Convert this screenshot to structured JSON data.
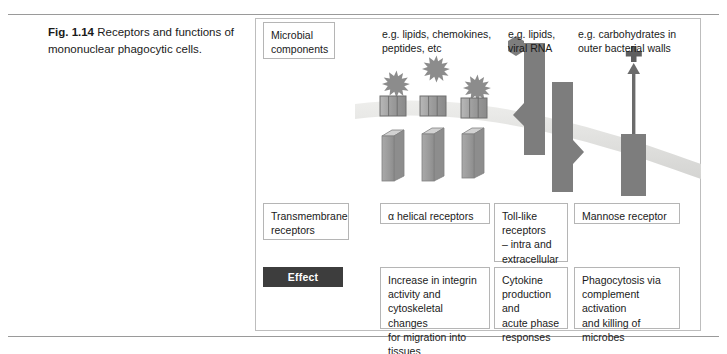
{
  "figure": {
    "number": "Fig. 1.14",
    "caption": "Receptors and functions of mononuclear phagocytic cells."
  },
  "row_labels": {
    "microbial_components": "Microbial\ncomponents",
    "transmembrane_receptors": "Transmembrane\nreceptors",
    "effect": "Effect"
  },
  "ligands": [
    {
      "name": "alpha-helical-ligands",
      "text": "e.g. lipids, chemokines,\npeptides, etc"
    },
    {
      "name": "toll-like-ligands",
      "text": "e.g. lipids,\nviral RNA"
    },
    {
      "name": "mannose-ligands",
      "text": "e.g. carbohydrates in\nouter bacterial walls"
    }
  ],
  "receptors": [
    {
      "name": "alpha-helical-receptor",
      "text": "α helical receptors"
    },
    {
      "name": "toll-like-receptor",
      "text": "Toll-like\nreceptors\n– intra and\nextracellular"
    },
    {
      "name": "mannose-receptor",
      "text": "Mannose receptor"
    }
  ],
  "effects": [
    {
      "name": "integrin-effect",
      "text": "Increase in integrin\nactivity and\ncytoskeletal changes\nfor migration into\ntissues"
    },
    {
      "name": "cytokine-effect",
      "text": "Cytokine\nproduction and\nacute phase\nresponses"
    },
    {
      "name": "phagocytosis-effect",
      "text": "Phagocytosis via\ncomplement activation\nand killing of\nmicrobes"
    }
  ],
  "colors": {
    "membrane": "#e2e2e0",
    "receptor_dark": "#7d7d7d",
    "receptor_mid": "#9d9d9d",
    "receptor_light": "#c6c6c6",
    "frame": "#bdbdbd",
    "rule": "#9a9a9a",
    "effect_chip_bg": "#3d3d3d",
    "effect_chip_text": "#ffffff",
    "text": "#1a1a1a"
  },
  "artwork": {
    "membrane_label": "cell-membrane-curve",
    "alpha_helical_count": 3,
    "ligand_star_count": 3,
    "toll_like_count": 2,
    "mannose_count": 1,
    "mannose_marker": "plus-sign",
    "toll_ligand_shape": "hexagon"
  }
}
